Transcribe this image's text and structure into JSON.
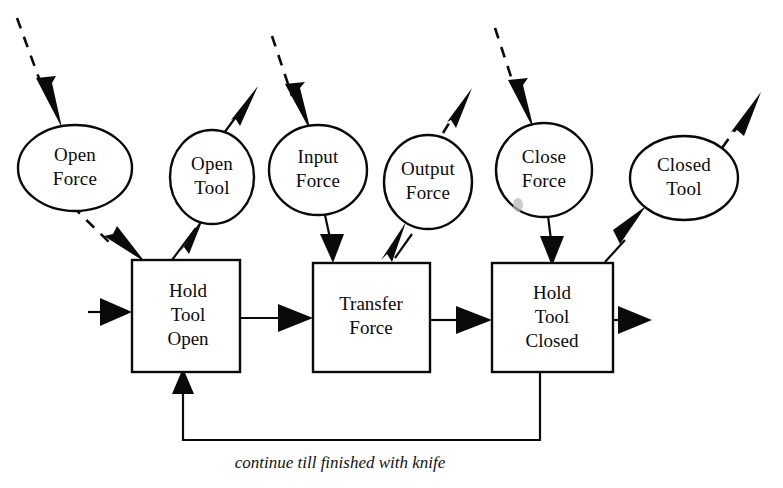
{
  "diagram": {
    "caption": "continue till finished with knife",
    "ink_color": "#0a0a0a",
    "background_color": "#ffffff",
    "ellipses": [
      {
        "id": "open-force",
        "label_line1": "Open",
        "label_line2": "Force",
        "cx": 75,
        "cy": 168,
        "rx": 57,
        "ry": 43
      },
      {
        "id": "open-tool",
        "label_line1": "Open",
        "label_line2": "Tool",
        "cx": 212,
        "cy": 177,
        "rx": 42,
        "ry": 47
      },
      {
        "id": "input-force",
        "label_line1": "Input",
        "label_line2": "Force",
        "cx": 318,
        "cy": 170,
        "rx": 49,
        "ry": 45
      },
      {
        "id": "output-force",
        "label_line1": "Output",
        "label_line2": "Force",
        "cx": 428,
        "cy": 182,
        "rx": 44,
        "ry": 47
      },
      {
        "id": "close-force",
        "label_line1": "Close",
        "label_line2": "Force",
        "cx": 544,
        "cy": 170,
        "rx": 48,
        "ry": 47
      },
      {
        "id": "closed-tool",
        "label_line1": "Closed",
        "label_line2": "Tool",
        "cx": 684,
        "cy": 178,
        "rx": 54,
        "ry": 42
      }
    ],
    "boxes": [
      {
        "id": "hold-tool-open",
        "lines": [
          "Hold",
          "Tool",
          "Open"
        ],
        "x": 132,
        "y": 260,
        "w": 108,
        "h": 112
      },
      {
        "id": "transfer-force",
        "lines": [
          "Transfer",
          "Force"
        ],
        "x": 313,
        "y": 263,
        "w": 117,
        "h": 109
      },
      {
        "id": "hold-tool-closed",
        "lines": [
          "Hold",
          "Tool",
          "Closed"
        ],
        "x": 492,
        "y": 263,
        "w": 121,
        "h": 109
      }
    ],
    "edges": [
      {
        "id": "external-open-force-in",
        "style": "dashed",
        "from": "external",
        "to": "open-force"
      },
      {
        "id": "open-force-to-hold-tool-open",
        "style": "dashed",
        "from": "open-force",
        "to": "hold-tool-open"
      },
      {
        "id": "hold-tool-open-to-open-tool",
        "style": "solid",
        "from": "hold-tool-open",
        "to": "open-tool"
      },
      {
        "id": "open-tool-out",
        "style": "solid",
        "from": "open-tool",
        "to": "external"
      },
      {
        "id": "external-input-force-in",
        "style": "dashed",
        "from": "external",
        "to": "input-force"
      },
      {
        "id": "input-force-to-transfer-force",
        "style": "solid",
        "from": "input-force",
        "to": "transfer-force"
      },
      {
        "id": "transfer-force-to-output-force",
        "style": "solid",
        "from": "transfer-force",
        "to": "output-force"
      },
      {
        "id": "output-force-out",
        "style": "dashed",
        "from": "output-force",
        "to": "external"
      },
      {
        "id": "external-close-force-in",
        "style": "dashed",
        "from": "external",
        "to": "close-force"
      },
      {
        "id": "close-force-to-hold-closed",
        "style": "dashed",
        "from": "close-force",
        "to": "hold-tool-closed"
      },
      {
        "id": "hold-closed-to-closed-tool",
        "style": "solid",
        "from": "hold-tool-closed",
        "to": "closed-tool"
      },
      {
        "id": "closed-tool-out",
        "style": "dashed",
        "from": "closed-tool",
        "to": "external"
      },
      {
        "id": "external-in-hold-tool-open",
        "style": "solid",
        "from": "external",
        "to": "hold-tool-open"
      },
      {
        "id": "hold-open-to-transfer",
        "style": "solid",
        "from": "hold-tool-open",
        "to": "transfer-force"
      },
      {
        "id": "transfer-to-hold-closed",
        "style": "solid",
        "from": "transfer-force",
        "to": "hold-tool-closed"
      },
      {
        "id": "hold-closed-output",
        "style": "solid",
        "from": "hold-tool-closed",
        "to": "external"
      },
      {
        "id": "feedback-loop",
        "style": "solid",
        "from": "hold-tool-closed",
        "to": "hold-tool-open"
      }
    ]
  }
}
